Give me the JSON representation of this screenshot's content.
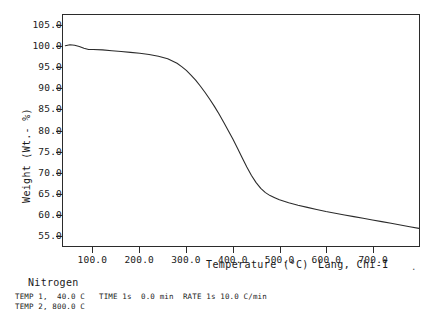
{
  "chart_data": {
    "type": "line",
    "title": "",
    "xlabel": "Temperature (°C)",
    "ylabel": "Weight (Wt.- %)",
    "xlim": [
      35,
      800
    ],
    "ylim": [
      52.5,
      107.5
    ],
    "grid": false,
    "legend": "none",
    "x_ticks": [
      100.0,
      200.0,
      300.0,
      400.0,
      500.0,
      600.0,
      700.0
    ],
    "x_tick_labels": [
      "100.0",
      "200.0",
      "300.0",
      "400.0",
      "500.0",
      "600.0",
      "700.0"
    ],
    "y_ticks": [
      55.0,
      60.0,
      65.0,
      70.0,
      75.0,
      80.0,
      85.0,
      90.0,
      95.0,
      100.0,
      105.0
    ],
    "y_tick_labels": [
      "55.0",
      "60.0",
      "65.0",
      "70.0",
      "75.0",
      "80.0",
      "85.0",
      "90.0",
      "95.0",
      "100.0",
      "105.0"
    ],
    "series": [
      {
        "name": "TGA weight loss",
        "color": "#2b2b2b",
        "x": [
          40,
          50,
          60,
          70,
          80,
          90,
          100,
          120,
          140,
          160,
          180,
          200,
          220,
          240,
          260,
          280,
          290,
          300,
          310,
          320,
          330,
          340,
          350,
          360,
          370,
          380,
          390,
          400,
          410,
          420,
          430,
          440,
          450,
          460,
          470,
          480,
          490,
          500,
          520,
          540,
          560,
          580,
          600,
          620,
          640,
          660,
          680,
          700,
          720,
          740,
          760,
          780,
          800
        ],
        "y": [
          100.2,
          100.4,
          100.3,
          100.0,
          99.6,
          99.3,
          99.3,
          99.2,
          99.0,
          98.8,
          98.6,
          98.4,
          98.1,
          97.7,
          97.1,
          96.0,
          95.2,
          94.3,
          93.2,
          92.0,
          90.6,
          89.1,
          87.5,
          85.8,
          84.0,
          82.0,
          80.0,
          78.0,
          75.8,
          73.5,
          71.3,
          69.3,
          67.6,
          66.2,
          65.2,
          64.5,
          64.0,
          63.5,
          62.8,
          62.2,
          61.7,
          61.2,
          60.7,
          60.3,
          59.9,
          59.5,
          59.1,
          58.7,
          58.3,
          57.9,
          57.5,
          57.1,
          56.7
        ]
      }
    ],
    "annotations": {
      "operator": "Lang, Chi-I",
      "atmosphere": "Nitrogen",
      "method_line_1": "TEMP 1,  40.0 C   TIME 1s  0.0 min  RATE 1s 10.0 C/min",
      "method_line_2": "TEMP 2, 800.0 C",
      "trailing_mark": "."
    }
  }
}
